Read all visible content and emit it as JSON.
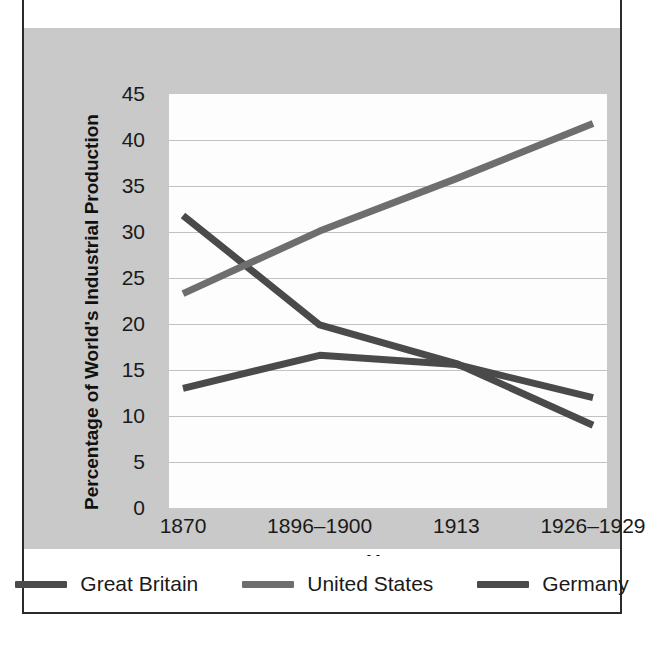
{
  "chart_data": {
    "type": "line",
    "title": "",
    "xlabel": "Year",
    "ylabel": "Percentage of World's Industrial Production",
    "categories": [
      "1870",
      "1896–1900",
      "1913",
      "1926–1929"
    ],
    "x": [
      0,
      1,
      2,
      3
    ],
    "ylim": [
      0,
      45
    ],
    "ytick_values": [
      0,
      5,
      10,
      15,
      20,
      25,
      30,
      35,
      40,
      45
    ],
    "ytick_labels": [
      "0",
      "5",
      "10",
      "15",
      "20",
      "25",
      "30",
      "35",
      "40",
      "45"
    ],
    "grid": "horizontal",
    "legend_position": "bottom",
    "series": [
      {
        "name": "Great Britain",
        "color": "#4a4a4a",
        "values": [
          31.8,
          19.9,
          15.7,
          9.0
        ]
      },
      {
        "name": "United States",
        "color": "#6e6e6e",
        "values": [
          23.3,
          30.1,
          35.8,
          41.8
        ]
      },
      {
        "name": "Germany",
        "color": "#4a4a4a",
        "values": [
          13.0,
          16.6,
          15.6,
          12.0
        ]
      }
    ]
  },
  "colors": {
    "page_background": "#ffffff",
    "frame_border": "#2b2b2b",
    "chart_band_background": "#c9c9c9",
    "plot_background": "#fdfdfd",
    "gridline": "#c2c2c2",
    "text": "#1a1a1a"
  },
  "axes": {
    "y_title": "Percentage of World's Industrial Production",
    "x_title": "Year"
  },
  "legend": {
    "items": [
      {
        "label": "Great Britain",
        "color": "#4a4a4a"
      },
      {
        "label": "United States",
        "color": "#6e6e6e"
      },
      {
        "label": "Germany",
        "color": "#4a4a4a"
      }
    ]
  }
}
